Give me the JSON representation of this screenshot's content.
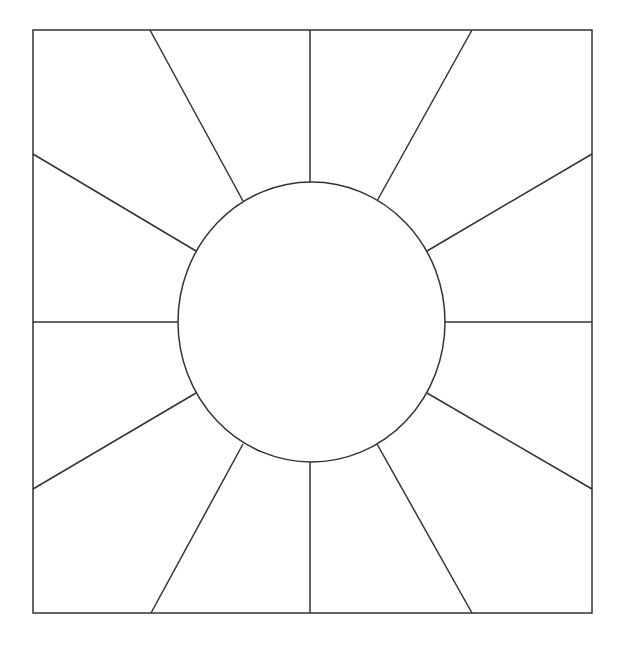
{
  "diagram": {
    "stroke_color": "#333333",
    "background": "#ffffff",
    "square": {
      "x": 33,
      "y": 30,
      "width": 559,
      "height": 583
    },
    "circle": {
      "cx": 311.5,
      "cy": 322,
      "rx": 133.5,
      "ry": 140
    },
    "rays": [
      {
        "x1": 310,
        "y1": 30,
        "x2": 310,
        "y2": 182
      },
      {
        "x1": 150,
        "y1": 30,
        "x2": 243,
        "y2": 201
      },
      {
        "x1": 472,
        "y1": 30,
        "x2": 377,
        "y2": 201
      },
      {
        "x1": 33,
        "y1": 154,
        "x2": 196,
        "y2": 251
      },
      {
        "x1": 592,
        "y1": 154,
        "x2": 427,
        "y2": 251
      },
      {
        "x1": 33,
        "y1": 322,
        "x2": 178,
        "y2": 322
      },
      {
        "x1": 592,
        "y1": 322,
        "x2": 445,
        "y2": 322
      },
      {
        "x1": 33,
        "y1": 489,
        "x2": 196,
        "y2": 393
      },
      {
        "x1": 592,
        "y1": 489,
        "x2": 427,
        "y2": 393
      },
      {
        "x1": 151,
        "y1": 613,
        "x2": 243,
        "y2": 444
      },
      {
        "x1": 472,
        "y1": 613,
        "x2": 377,
        "y2": 444
      },
      {
        "x1": 310,
        "y1": 613,
        "x2": 310,
        "y2": 462
      }
    ]
  }
}
